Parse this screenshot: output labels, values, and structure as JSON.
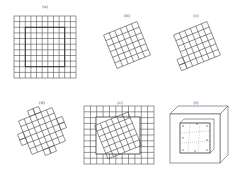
{
  "figure": {
    "panels": [
      {
        "id": "a",
        "label": "(a)",
        "description": "Square 11x11 grid with inner bold square outline"
      },
      {
        "id": "b",
        "label": "(b)",
        "description": "Rotated 6x6 grid patch"
      },
      {
        "id": "c",
        "label": "(c)",
        "description": "Rotated grid patch with stepped edge"
      },
      {
        "id": "d",
        "label": "(d)",
        "description": "Rotated cross-shaped grid patch"
      },
      {
        "id": "e",
        "label": "(e)",
        "description": "Square grid with rotated grid patch embedded in center"
      },
      {
        "id": "f",
        "label": "(f)",
        "description": "3D box frame containing inner grid patch"
      }
    ],
    "colors": {
      "line": "#555555",
      "bold_line": "#333333",
      "background": "#ffffff"
    }
  }
}
